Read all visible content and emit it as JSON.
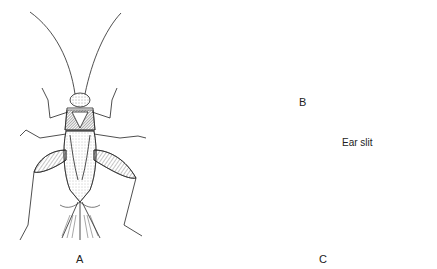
{
  "figure": {
    "panels": [
      {
        "id": "A",
        "label": "A",
        "description": "dorsal view of cricket"
      },
      {
        "id": "B",
        "label": "B",
        "description": "lateral view of mole cricket"
      },
      {
        "id": "C",
        "label": "C",
        "description": "foreleg detail"
      }
    ],
    "annotations": {
      "ear_slit": "Ear slit"
    },
    "colors": {
      "ink": "#222222",
      "background": "#ffffff"
    }
  }
}
